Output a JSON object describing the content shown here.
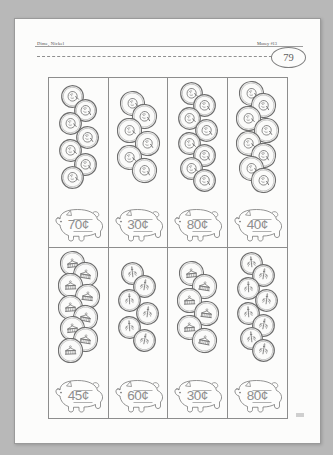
{
  "worksheet": {
    "header_left": "Dime, Nickel",
    "header_right": "Money #13",
    "page_number": "79",
    "cut_line": "dashed-cut-line"
  },
  "cells": [
    {
      "id": "cell-1",
      "coin_type": "dime",
      "coin_count": 7,
      "coin_face": "obverse",
      "answer": "70¢"
    },
    {
      "id": "cell-2",
      "coin_type": "nickel",
      "coin_count": 6,
      "coin_face": "obverse",
      "answer": "30¢"
    },
    {
      "id": "cell-3",
      "coin_type": "dime",
      "coin_count": 8,
      "coin_face": "obverse",
      "answer": "80¢"
    },
    {
      "id": "cell-4",
      "coin_type": "nickel",
      "coin_count": 8,
      "coin_face": "obverse",
      "answer": "40¢"
    },
    {
      "id": "cell-5",
      "coin_type": "nickel",
      "coin_count": 9,
      "coin_face": "reverse",
      "answer": "45¢"
    },
    {
      "id": "cell-6",
      "coin_type": "dime",
      "coin_count": 6,
      "coin_face": "reverse",
      "answer": "60¢"
    },
    {
      "id": "cell-7",
      "coin_type": "nickel",
      "coin_count": 6,
      "coin_face": "reverse",
      "answer": "30¢"
    },
    {
      "id": "cell-8",
      "coin_type": "dime",
      "coin_count": 8,
      "coin_face": "reverse",
      "answer": "80¢"
    }
  ],
  "colors": {
    "paper": "#fcfcfb",
    "ink": "#6f6f6f",
    "handwriting": "#8e8e8e",
    "backdrop": "#b8b8b8"
  }
}
